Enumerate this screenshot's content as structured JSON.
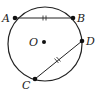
{
  "diagram": {
    "type": "circle-chords",
    "center_label": "O",
    "points": [
      {
        "label": "A",
        "x": 15,
        "y": 18
      },
      {
        "label": "B",
        "x": 73,
        "y": 18
      },
      {
        "label": "D",
        "x": 82,
        "y": 41
      },
      {
        "label": "C",
        "x": 35,
        "y": 79
      }
    ],
    "chords": [
      {
        "from": "A",
        "to": "B",
        "ticks": 2
      },
      {
        "from": "D",
        "to": "C",
        "ticks": 2
      }
    ],
    "circle": {
      "cx": 45,
      "cy": 44,
      "r": 37
    },
    "stroke_color": "#222222"
  }
}
